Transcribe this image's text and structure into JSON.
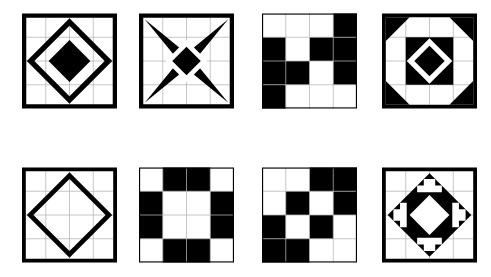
{
  "page": {
    "background_color": "#ffffff",
    "ink_color": "#000000",
    "grid_color": "#b4b4b4",
    "rows": 2,
    "columns": 4,
    "block_count": 8
  },
  "blocks": [
    {
      "id": "blk-1",
      "name": "diamond-in-square",
      "label": "Diamond in a Square",
      "row": 1,
      "column": 1,
      "grid": "4x4",
      "elements": [
        "outer-border",
        "large-diamond-outline",
        "center-solid-diamond"
      ],
      "fill": "#000000"
    },
    {
      "id": "blk-2",
      "name": "four-point-star",
      "label": "Four Point Star",
      "row": 1,
      "column": 2,
      "grid": "4x4",
      "elements": [
        "outer-border",
        "concave-four-point-star",
        "white-diamond-ring",
        "center-solid-diamond"
      ],
      "fill": "#000000"
    },
    {
      "id": "blk-3",
      "name": "stepping-stones",
      "label": "Stepping Stones",
      "row": 1,
      "column": 3,
      "grid": "4x4",
      "cells": [
        [
          "W",
          "W",
          "W",
          "B"
        ],
        [
          "B",
          "W",
          "B",
          "B"
        ],
        [
          "B",
          "B",
          "W",
          "B"
        ],
        [
          "B",
          "W",
          "W",
          "W"
        ]
      ],
      "fill": "#000000"
    },
    {
      "id": "blk-4",
      "name": "corner-triangles-diamond",
      "label": "Corner Triangles with Diamond",
      "row": 1,
      "column": 4,
      "grid": "4x4",
      "elements": [
        "outer-border",
        "four-corner-triangles",
        "center-black-square",
        "white-diamond-ring",
        "center-solid-diamond"
      ],
      "fill": "#000000"
    },
    {
      "id": "blk-5",
      "name": "plain-diamond-outline",
      "label": "Diamond Outline",
      "row": 2,
      "column": 1,
      "grid": "4x4",
      "elements": [
        "outer-border",
        "large-diamond-outline"
      ],
      "fill": "#000000"
    },
    {
      "id": "blk-6",
      "name": "cross-frame",
      "label": "Cross Frame",
      "row": 2,
      "column": 2,
      "grid": "4x4",
      "cells": [
        [
          "W",
          "B",
          "B",
          "W"
        ],
        [
          "B",
          "W",
          "W",
          "B"
        ],
        [
          "B",
          "W",
          "W",
          "B"
        ],
        [
          "W",
          "B",
          "B",
          "W"
        ]
      ],
      "fill": "#000000"
    },
    {
      "id": "blk-7",
      "name": "diagonal-checkerboard",
      "label": "Diagonal Checkerboard",
      "row": 2,
      "column": 3,
      "grid": "4x4",
      "cells": [
        [
          "W",
          "W",
          "B",
          "B"
        ],
        [
          "W",
          "B",
          "W",
          "B"
        ],
        [
          "B",
          "W",
          "B",
          "W"
        ],
        [
          "B",
          "B",
          "W",
          "W"
        ]
      ],
      "fill": "#000000"
    },
    {
      "id": "blk-8",
      "name": "diamond-with-crosses",
      "label": "Diamond with Four Crosses",
      "row": 2,
      "column": 4,
      "grid": "4x4",
      "elements": [
        "outer-border",
        "large-black-diamond",
        "four-white-crosses",
        "center-white-diamond"
      ],
      "fill": "#000000"
    }
  ]
}
